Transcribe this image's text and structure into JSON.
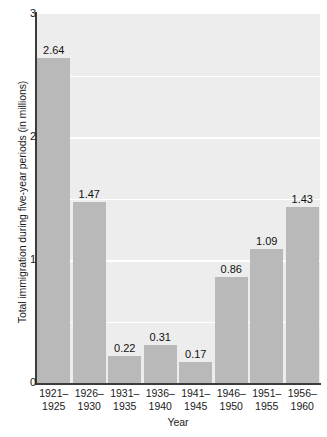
{
  "chart_data": {
    "type": "bar",
    "title": "",
    "subtitle": "",
    "xlabel": "Year",
    "ylabel": "Total immigration during five-year periods (in millions)",
    "categories": [
      "1921–1925",
      "1926–1930",
      "1931–1935",
      "1936–1940",
      "1941–1945",
      "1946–1950",
      "1951–1955",
      "1956–1960"
    ],
    "category_lines": [
      [
        "1921–",
        "1925"
      ],
      [
        "1926–",
        "1930"
      ],
      [
        "1931–",
        "1935"
      ],
      [
        "1936–",
        "1940"
      ],
      [
        "1941–",
        "1945"
      ],
      [
        "1946–",
        "1950"
      ],
      [
        "1951–",
        "1955"
      ],
      [
        "1956–",
        "1960"
      ]
    ],
    "values": [
      2.64,
      1.47,
      0.22,
      0.31,
      0.17,
      0.86,
      1.09,
      1.43
    ],
    "value_labels": [
      "2.64",
      "1.47",
      "0.22",
      "0.31",
      "0.17",
      "0.86",
      "1.09",
      "1.43"
    ],
    "ylim": [
      0,
      3
    ],
    "xlim_note": "categorical",
    "yticks": [
      0,
      1,
      2,
      3
    ],
    "ytick_labels": [
      "0",
      "1",
      "2",
      "3"
    ],
    "gridlines_y": [
      0.5,
      1.0,
      1.5,
      2.0,
      2.5
    ],
    "grid": true,
    "grid_orientation": "horizontal",
    "legend": null,
    "legend_position": "none",
    "colors": {
      "bar_fill": "#b9b9b9",
      "plot_background": "#ededed",
      "gridline": "#ffffff",
      "axis_line": "#3b3b3b",
      "text": "#1a1a1a",
      "page_background": "#ffffff"
    }
  }
}
